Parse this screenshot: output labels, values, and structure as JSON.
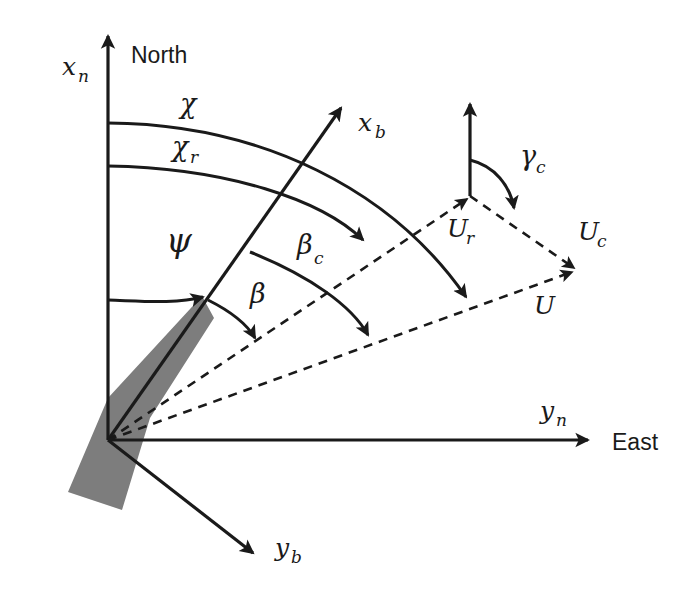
{
  "figure": {
    "kind": "vector-diagram",
    "background_color": "#ffffff",
    "line_color": "#1a1a1a",
    "hull_color": "#7d7d7d"
  },
  "compass": {
    "north_label": "North",
    "east_label": "East"
  },
  "axes": {
    "ned_x": {
      "label": "x",
      "subscript": "n",
      "direction": "up",
      "style": "solid"
    },
    "ned_y": {
      "label": "y",
      "subscript": "n",
      "direction": "right",
      "style": "solid"
    },
    "body_x": {
      "label": "x",
      "subscript": "b",
      "direction": "up-right",
      "style": "solid"
    },
    "body_y": {
      "label": "y",
      "subscript": "b",
      "direction": "down-right",
      "style": "solid"
    },
    "current_north": {
      "label": "",
      "direction": "up",
      "style": "solid"
    }
  },
  "angles": [
    {
      "id": "chi",
      "label": "χ",
      "subscript": "",
      "name": "course-angle",
      "from": "x_n",
      "to": "U"
    },
    {
      "id": "chi_r",
      "label": "χ",
      "subscript": "r",
      "name": "relative-course-angle",
      "from": "x_n",
      "to": "U_r"
    },
    {
      "id": "psi",
      "label": "ψ",
      "subscript": "",
      "name": "heading-angle",
      "from": "x_n",
      "to": "x_b"
    },
    {
      "id": "beta",
      "label": "β",
      "subscript": "",
      "name": "sideslip-angle",
      "from": "x_b",
      "to": "U_r"
    },
    {
      "id": "beta_c",
      "label": "β",
      "subscript": "c",
      "name": "crab-angle",
      "from": "x_b",
      "to": "U"
    },
    {
      "id": "gamma_c",
      "label": "γ",
      "subscript": "c",
      "name": "current-direction-angle",
      "from": "north",
      "to": "U_c"
    }
  ],
  "vectors": [
    {
      "id": "U_r",
      "label": "U",
      "subscript": "r",
      "name": "relative-velocity-vector",
      "style": "dashed"
    },
    {
      "id": "U_c",
      "label": "U",
      "subscript": "c",
      "name": "current-velocity-vector",
      "style": "dashed"
    },
    {
      "id": "U",
      "label": "U",
      "subscript": "",
      "name": "total-velocity-vector",
      "style": "dashed"
    }
  ],
  "vessel": {
    "name": "ship-hull",
    "fill": "#7d7d7d"
  }
}
